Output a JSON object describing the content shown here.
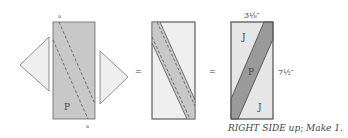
{
  "colors": {
    "light_fabric": "#efefef",
    "print_fabric": "#c8c8c8",
    "strip_fabric": "#9a9a9a",
    "outline": "#555555"
  },
  "step1": {
    "center_label": "P",
    "top_seam_mark": "a",
    "bottom_seam_mark": "a"
  },
  "operators": {
    "equals_1": "=",
    "equals_2": "="
  },
  "result": {
    "top_patch_label": "J",
    "center_patch_label": "P",
    "bottom_patch_label": "J",
    "width_dimension": "3⅛″",
    "height_dimension": "7½″",
    "caption": "RIGHT SIDE up; Make 1."
  }
}
